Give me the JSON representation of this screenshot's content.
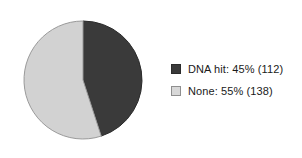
{
  "chart_data": {
    "type": "pie",
    "title": "",
    "categories": [
      "DNA hit",
      "None"
    ],
    "values": [
      45,
      55
    ],
    "counts": [
      112,
      138
    ],
    "total": 250,
    "units": "percent",
    "start_angle_deg": 0,
    "direction": "clockwise",
    "legend_position": "right",
    "grid": false,
    "slices": [
      {
        "label": "DNA hit",
        "percent": 45,
        "count": 112,
        "color": "#3a3a3a",
        "edge_color": "#2b2b2b",
        "sweep_deg": 162,
        "legend_text": "DNA hit: 45% (112)"
      },
      {
        "label": "None",
        "percent": 55,
        "count": 138,
        "color": "#d2d2d2",
        "edge_color": "#9a9a9a",
        "sweep_deg": 198,
        "legend_text": "None: 55% (138)"
      }
    ]
  },
  "legend": {
    "items": [
      {
        "text": "DNA hit: 45% (112)",
        "swatch_color": "#3a3a3a",
        "swatch_border": "#2b2b2b",
        "icon": "legend-swatch-filled"
      },
      {
        "text": "None: 55% (138)",
        "swatch_color": "#d8d8d8",
        "swatch_border": "#8f8f8f",
        "icon": "legend-swatch-outlined"
      }
    ]
  },
  "figure": {
    "background": "#ffffff"
  }
}
